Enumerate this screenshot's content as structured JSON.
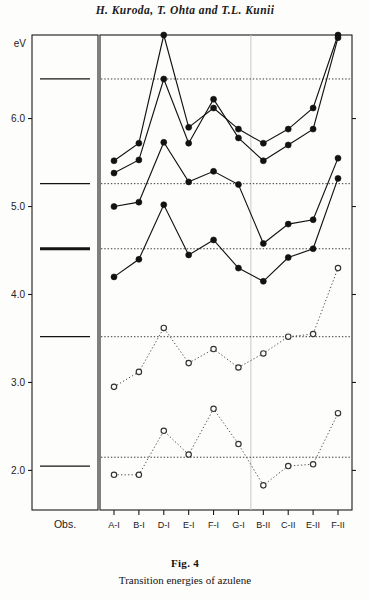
{
  "running_head": "H. Kuroda, T. Ohta and T.L. Kunii",
  "caption": {
    "figure_number": "Fig. 4",
    "text": "Transition energies of azulene"
  },
  "axes": {
    "y_unit_label": "eV",
    "y_ticks": [
      "6.0",
      "5.0",
      "4.0",
      "3.0",
      "2.0"
    ],
    "y_tick_values": [
      6.0,
      5.0,
      4.0,
      3.0,
      2.0
    ],
    "y_min": 1.55,
    "y_max": 6.95,
    "x_axis_title": "Parameters",
    "obs_panel_label": "Obs."
  },
  "colors": {
    "ink": "#141414",
    "solid_series": "#121212",
    "open_series": "#333333",
    "reference_line": "#222222",
    "frame": "#1a1a1a",
    "divider": "#c9c9c9",
    "background": "#fdfdfb"
  },
  "chart_data": {
    "type": "line",
    "title": "Transition energies of azulene",
    "xlabel": "Parameters",
    "ylabel": "eV",
    "ylim": [
      1.55,
      6.95
    ],
    "grid": false,
    "legend": "none",
    "categories": [
      "A-I",
      "B-I",
      "D-I",
      "E-I",
      "F-I",
      "G-I",
      "B-II",
      "C-II",
      "E-II",
      "F-II"
    ],
    "observed": {
      "label": "Obs.",
      "values": [
        6.45,
        5.26,
        4.52,
        3.52,
        2.05
      ],
      "emphasis": [
        false,
        false,
        true,
        false,
        false
      ]
    },
    "reference_lines": [
      6.45,
      5.26,
      4.52,
      3.52,
      2.15
    ],
    "series": [
      {
        "name": "calculated-band-1",
        "marker": "filled-circle",
        "line": "solid",
        "values": [
          5.52,
          5.72,
          6.95,
          5.9,
          6.12,
          5.88,
          5.72,
          5.88,
          6.12,
          6.95
        ]
      },
      {
        "name": "calculated-band-2",
        "marker": "filled-circle",
        "line": "solid",
        "values": [
          5.38,
          5.53,
          6.45,
          5.72,
          6.22,
          5.78,
          5.52,
          5.7,
          5.88,
          6.92
        ]
      },
      {
        "name": "calculated-band-3",
        "marker": "filled-circle",
        "line": "solid",
        "values": [
          5.0,
          5.05,
          5.73,
          5.28,
          5.4,
          5.25,
          4.58,
          4.8,
          4.85,
          5.55
        ]
      },
      {
        "name": "calculated-band-4",
        "marker": "filled-circle",
        "line": "solid",
        "values": [
          4.2,
          4.4,
          5.02,
          4.45,
          4.62,
          4.3,
          4.15,
          4.42,
          4.52,
          5.32
        ]
      },
      {
        "name": "calculated-band-5",
        "marker": "open-circle",
        "line": "dotted",
        "values": [
          2.95,
          3.12,
          3.62,
          3.22,
          3.38,
          3.17,
          3.33,
          3.52,
          3.55,
          4.3
        ]
      },
      {
        "name": "calculated-band-6",
        "marker": "open-circle",
        "line": "dotted",
        "values": [
          1.95,
          1.95,
          2.45,
          2.18,
          2.7,
          2.3,
          1.83,
          2.05,
          2.07,
          2.65
        ]
      }
    ]
  }
}
